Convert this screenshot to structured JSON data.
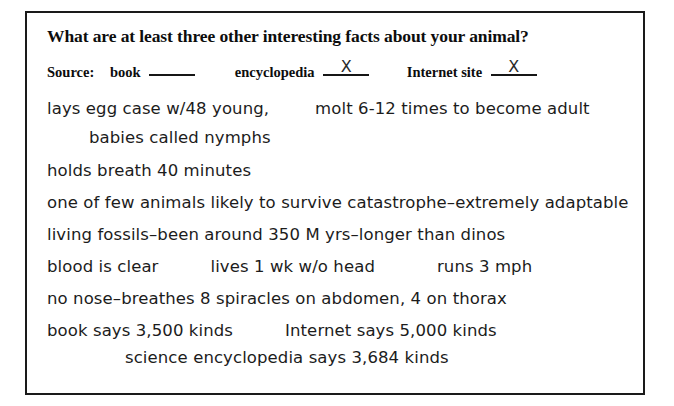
{
  "worksheet": {
    "question": "What are at least three other interesting facts about your animal?",
    "source": {
      "label": "Source:",
      "options": [
        {
          "name": "book",
          "mark": ""
        },
        {
          "name": "encyclopedia",
          "mark": "X"
        },
        {
          "name": "Internet site",
          "mark": "X"
        }
      ]
    },
    "answers": [
      {
        "id": "line-1",
        "indent": "none",
        "segments": [
          "lays egg case w/48 young,",
          "molt 6-12 times to become adult"
        ]
      },
      {
        "id": "line-2",
        "indent": "one",
        "segments": [
          "babies called nymphs"
        ]
      },
      {
        "id": "line-3",
        "indent": "none",
        "segments": [
          "holds breath 40 minutes"
        ]
      },
      {
        "id": "line-4",
        "indent": "none",
        "segments": [
          "one of few animals likely to survive catastrophe–extremely adaptable"
        ]
      },
      {
        "id": "line-5",
        "indent": "none",
        "segments": [
          "living fossils–been around 350 M yrs–longer than dinos"
        ]
      },
      {
        "id": "line-6",
        "indent": "none",
        "segments": [
          "blood is clear",
          "lives 1 wk w/o head",
          "runs 3 mph"
        ]
      },
      {
        "id": "line-7",
        "indent": "none",
        "segments": [
          "no nose–breathes 8 spiracles on abdomen, 4 on thorax"
        ]
      },
      {
        "id": "line-8",
        "indent": "none",
        "segments": [
          "book says 3,500 kinds",
          "Internet says 5,000 kinds"
        ]
      },
      {
        "id": "line-9",
        "indent": "two",
        "segments": [
          "science encyclopedia says 3,684 kinds"
        ]
      }
    ]
  },
  "colors": {
    "page_background": "#ffffff",
    "box_border": "#1a1a1a",
    "printed_text": "#0d0d0d",
    "handwriting": "#1c1c1c"
  }
}
